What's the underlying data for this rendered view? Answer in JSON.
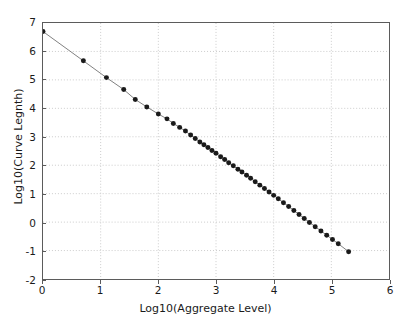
{
  "chart_data": {
    "type": "line",
    "title": "",
    "xlabel": "Log10(Aggregate Level)",
    "ylabel": "Log10(Curve Legnth)",
    "xlim": [
      0,
      6
    ],
    "ylim": [
      -2,
      7
    ],
    "xticks": [
      0,
      1,
      2,
      3,
      4,
      5,
      6
    ],
    "yticks": [
      -2,
      -1,
      0,
      1,
      2,
      3,
      4,
      5,
      6,
      7
    ],
    "grid": true,
    "grid_style": "dotted",
    "grid_color": "#cccccc",
    "legend": null,
    "marker": "circle",
    "marker_color": "#1a1a1a",
    "marker_size": 5,
    "line_color": "#808080",
    "line_width": 1,
    "series": [
      {
        "name": "curve length vs aggregate level",
        "x": [
          0.0,
          0.7,
          1.1,
          1.4,
          1.6,
          1.8,
          2.0,
          2.15,
          2.26,
          2.37,
          2.47,
          2.56,
          2.64,
          2.72,
          2.79,
          2.86,
          2.93,
          3.0,
          3.08,
          3.15,
          3.22,
          3.3,
          3.38,
          3.45,
          3.53,
          3.6,
          3.68,
          3.76,
          3.84,
          3.92,
          4.0,
          4.08,
          4.17,
          4.26,
          4.35,
          4.44,
          4.53,
          4.62,
          4.72,
          4.82,
          4.92,
          5.02,
          5.12,
          5.3
        ],
        "y": [
          6.7,
          5.67,
          5.08,
          4.66,
          4.31,
          4.05,
          3.8,
          3.63,
          3.47,
          3.33,
          3.2,
          3.06,
          2.94,
          2.82,
          2.72,
          2.62,
          2.52,
          2.42,
          2.3,
          2.2,
          2.09,
          1.98,
          1.86,
          1.76,
          1.65,
          1.54,
          1.42,
          1.3,
          1.18,
          1.06,
          0.94,
          0.82,
          0.68,
          0.55,
          0.41,
          0.27,
          0.13,
          -0.01,
          -0.16,
          -0.31,
          -0.46,
          -0.61,
          -0.76,
          -1.04
        ]
      }
    ]
  },
  "axes": {
    "xtick_labels": [
      "0",
      "1",
      "2",
      "3",
      "4",
      "5",
      "6"
    ],
    "ytick_labels": [
      "7",
      "6",
      "5",
      "4",
      "3",
      "2",
      "1",
      "0",
      "-1",
      "-2"
    ]
  }
}
